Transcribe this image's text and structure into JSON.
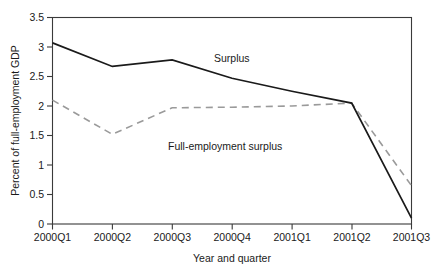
{
  "chart_data": {
    "type": "line",
    "title": "",
    "xlabel": "Year and quarter",
    "ylabel": "Percent of full-employment GDP",
    "categories": [
      "2000Q1",
      "2000Q2",
      "2000Q3",
      "2000Q4",
      "2001Q1",
      "2001Q2",
      "2001Q3"
    ],
    "yticks": [
      "0",
      "0.5",
      "1",
      "1.5",
      "2",
      "2.5",
      "3",
      "3.5"
    ],
    "ytick_values": [
      0,
      0.5,
      1,
      1.5,
      2,
      2.5,
      3,
      3.5
    ],
    "ylim": [
      0,
      3.5
    ],
    "grid": false,
    "legend": "inline-annotations",
    "series": [
      {
        "name": "Surplus",
        "style": "solid",
        "color": "#1a1a1a",
        "values": [
          3.07,
          2.67,
          2.78,
          2.47,
          2.25,
          2.05,
          0.1
        ]
      },
      {
        "name": "Full-employment surplus",
        "style": "dashed",
        "color": "#9a9a9a",
        "values": [
          2.1,
          1.52,
          1.97,
          1.98,
          2.0,
          2.05,
          0.65
        ]
      }
    ],
    "annotations": [
      {
        "text": "Surplus",
        "x_category": "2000Q4",
        "y_value": 2.85
      },
      {
        "text": "Full-employment surplus",
        "x_category": "2000Q3",
        "y_value": 1.72
      }
    ]
  },
  "axis": {
    "y_title": "Percent of full-employment GDP",
    "x_title": "Year and quarter"
  },
  "ticks": {
    "y": [
      "3.5",
      "3",
      "2.5",
      "2",
      "1.5",
      "1",
      "0.5",
      "0"
    ],
    "x": [
      "2000Q1",
      "2000Q2",
      "2000Q3",
      "2000Q4",
      "2001Q1",
      "2001Q2",
      "2001Q3"
    ]
  },
  "labels": {
    "surplus": "Surplus",
    "full_employment_surplus": "Full-employment surplus"
  }
}
